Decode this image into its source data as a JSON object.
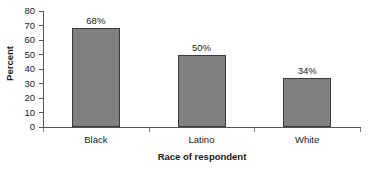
{
  "chart_data": {
    "type": "bar",
    "title": "",
    "subtitle": "",
    "xlabel": "Race of respondent",
    "ylabel": "Percent",
    "categories": [
      "Black",
      "Latino",
      "White"
    ],
    "values": [
      68,
      50,
      34
    ],
    "data_labels": [
      "68%",
      "50%",
      "34%"
    ],
    "ylim": [
      0,
      80
    ],
    "ytick_values": [
      0,
      10,
      20,
      30,
      40,
      50,
      60,
      70,
      80
    ],
    "ytick_labels": [
      "0",
      "10",
      "20",
      "30",
      "40",
      "50",
      "60",
      "70",
      "80"
    ],
    "grid": false,
    "legend": null,
    "legend_position": "none",
    "series": [
      {
        "name": "Percent",
        "values": [
          68,
          50,
          34
        ],
        "color": "#808080",
        "border_color": "#3a3a3a"
      }
    ],
    "colors": {
      "bar_fill": "#808080",
      "bar_border": "#3a3a3a",
      "axis": "#555555",
      "text": "#1a1a1a",
      "background": "#ffffff"
    }
  }
}
